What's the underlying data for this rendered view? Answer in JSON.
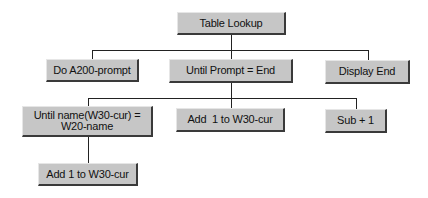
{
  "diagram": {
    "type": "structure-chart",
    "colors": {
      "background": "#ffffff",
      "node_fill": "#c6c6c6",
      "node_shadow": "#3a3a3a",
      "connector": "#222222",
      "text": "#111111"
    },
    "nodes": {
      "root": {
        "label": "Table Lookup"
      },
      "do": {
        "label": "Do A200-prompt"
      },
      "until": {
        "label": "Until Prompt = End"
      },
      "disp": {
        "label": "Display End"
      },
      "untn": {
        "label": "Until name(W30-cur) =\nW20-name"
      },
      "add1": {
        "label": "Add  1 to W30-cur"
      },
      "sub": {
        "label": "Sub + 1"
      },
      "add2": {
        "label": "Add 1 to W30-cur"
      }
    },
    "edges": [
      {
        "from": "root",
        "to": "do"
      },
      {
        "from": "root",
        "to": "until"
      },
      {
        "from": "root",
        "to": "disp"
      },
      {
        "from": "until",
        "to": "untn"
      },
      {
        "from": "until",
        "to": "add1"
      },
      {
        "from": "until",
        "to": "sub"
      },
      {
        "from": "untn",
        "to": "add2"
      }
    ]
  }
}
